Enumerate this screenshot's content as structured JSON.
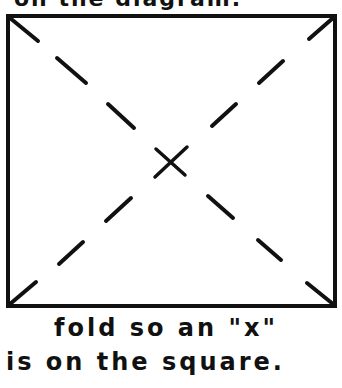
{
  "header_fragment": "on the diagram.",
  "diagram": {
    "shape": "square",
    "fold_lines": "two dashed diagonals",
    "center_mark": "x",
    "stroke_color": "#111111"
  },
  "caption": {
    "line1": "fold so an \"x\"",
    "line2": "is on the square."
  }
}
